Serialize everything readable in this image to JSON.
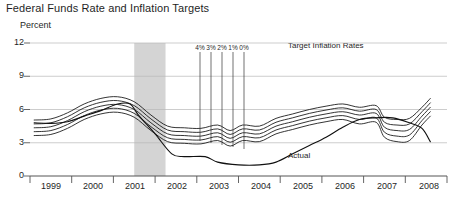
{
  "chart_data": {
    "type": "line",
    "title": "Federal Funds Rate and Inflation Targets",
    "subtitle": "Percent",
    "ylabel": "Percent",
    "xlabel": "",
    "ylim": [
      0,
      12
    ],
    "yticks": [
      0,
      3,
      6,
      9,
      12
    ],
    "ytick_labels": [
      "0",
      "3",
      "6",
      "9",
      "12"
    ],
    "xlim": [
      1998.5,
      2008.5
    ],
    "xtick_labels": [
      "1999",
      "2000",
      "2001",
      "2002",
      "2003",
      "2004",
      "2005",
      "2006",
      "2007",
      "2008"
    ],
    "grid": true,
    "legend_position": "inside-top-right",
    "annotations": {
      "target_rates_label": "Target Inflation Rates",
      "actual_label": "Actual",
      "target_tick_labels": [
        "4%",
        "3%",
        "2%",
        "1%",
        "0%"
      ],
      "recession_band": {
        "start": 2001.0,
        "end": 2001.75,
        "color": "#d4d4d4"
      }
    },
    "series": [
      {
        "name": "4% target",
        "label": "4%",
        "values": [
          [
            1998.6,
            5.05
          ],
          [
            1999.0,
            5.15
          ],
          [
            1999.4,
            5.7
          ],
          [
            1999.8,
            6.5
          ],
          [
            2000.2,
            7.0
          ],
          [
            2000.6,
            7.15
          ],
          [
            2001.0,
            6.7
          ],
          [
            2001.4,
            5.5
          ],
          [
            2001.8,
            4.5
          ],
          [
            2002.2,
            4.35
          ],
          [
            2002.6,
            4.3
          ],
          [
            2003.0,
            4.6
          ],
          [
            2003.3,
            4.1
          ],
          [
            2003.6,
            4.6
          ],
          [
            2004.0,
            4.5
          ],
          [
            2004.4,
            5.2
          ],
          [
            2004.8,
            5.6
          ],
          [
            2005.2,
            6.0
          ],
          [
            2005.6,
            6.3
          ],
          [
            2006.0,
            6.5
          ],
          [
            2006.4,
            6.2
          ],
          [
            2006.8,
            6.35
          ],
          [
            2007.0,
            5.3
          ],
          [
            2007.3,
            5.1
          ],
          [
            2007.6,
            5.2
          ],
          [
            2007.9,
            6.2
          ],
          [
            2008.1,
            7.0
          ]
        ]
      },
      {
        "name": "3% target",
        "label": "3%",
        "values": [
          [
            1998.6,
            4.7
          ],
          [
            1999.0,
            4.8
          ],
          [
            1999.4,
            5.35
          ],
          [
            1999.8,
            6.15
          ],
          [
            2000.2,
            6.65
          ],
          [
            2000.6,
            6.8
          ],
          [
            2001.0,
            6.35
          ],
          [
            2001.4,
            5.15
          ],
          [
            2001.8,
            4.15
          ],
          [
            2002.2,
            4.0
          ],
          [
            2002.6,
            3.95
          ],
          [
            2003.0,
            4.25
          ],
          [
            2003.3,
            3.75
          ],
          [
            2003.6,
            4.25
          ],
          [
            2004.0,
            4.15
          ],
          [
            2004.4,
            4.85
          ],
          [
            2004.8,
            5.25
          ],
          [
            2005.2,
            5.65
          ],
          [
            2005.6,
            5.95
          ],
          [
            2006.0,
            6.15
          ],
          [
            2006.4,
            5.85
          ],
          [
            2006.8,
            6.0
          ],
          [
            2007.0,
            4.85
          ],
          [
            2007.3,
            4.6
          ],
          [
            2007.6,
            4.7
          ],
          [
            2007.9,
            5.8
          ],
          [
            2008.1,
            6.6
          ]
        ]
      },
      {
        "name": "2% target",
        "label": "2%",
        "values": [
          [
            1998.6,
            4.35
          ],
          [
            1999.0,
            4.45
          ],
          [
            1999.4,
            5.0
          ],
          [
            1999.8,
            5.8
          ],
          [
            2000.2,
            6.3
          ],
          [
            2000.6,
            6.45
          ],
          [
            2001.0,
            6.0
          ],
          [
            2001.4,
            4.8
          ],
          [
            2001.8,
            3.8
          ],
          [
            2002.2,
            3.65
          ],
          [
            2002.6,
            3.6
          ],
          [
            2003.0,
            3.9
          ],
          [
            2003.3,
            3.4
          ],
          [
            2003.6,
            3.9
          ],
          [
            2004.0,
            3.8
          ],
          [
            2004.4,
            4.5
          ],
          [
            2004.8,
            4.9
          ],
          [
            2005.2,
            5.3
          ],
          [
            2005.6,
            5.6
          ],
          [
            2006.0,
            5.8
          ],
          [
            2006.4,
            5.5
          ],
          [
            2006.8,
            5.65
          ],
          [
            2007.0,
            4.4
          ],
          [
            2007.3,
            4.1
          ],
          [
            2007.6,
            4.2
          ],
          [
            2007.9,
            5.4
          ],
          [
            2008.1,
            6.2
          ]
        ]
      },
      {
        "name": "1% target",
        "label": "1%",
        "values": [
          [
            1998.6,
            4.0
          ],
          [
            1999.0,
            4.1
          ],
          [
            1999.4,
            4.65
          ],
          [
            1999.8,
            5.45
          ],
          [
            2000.2,
            5.95
          ],
          [
            2000.6,
            6.1
          ],
          [
            2001.0,
            5.65
          ],
          [
            2001.4,
            4.45
          ],
          [
            2001.8,
            3.45
          ],
          [
            2002.2,
            3.3
          ],
          [
            2002.6,
            3.25
          ],
          [
            2003.0,
            3.55
          ],
          [
            2003.3,
            3.05
          ],
          [
            2003.6,
            3.55
          ],
          [
            2004.0,
            3.45
          ],
          [
            2004.4,
            4.15
          ],
          [
            2004.8,
            4.55
          ],
          [
            2005.2,
            4.95
          ],
          [
            2005.6,
            5.25
          ],
          [
            2006.0,
            5.45
          ],
          [
            2006.4,
            5.1
          ],
          [
            2006.8,
            5.25
          ],
          [
            2007.0,
            3.95
          ],
          [
            2007.3,
            3.6
          ],
          [
            2007.6,
            3.7
          ],
          [
            2007.9,
            5.0
          ],
          [
            2008.1,
            5.8
          ]
        ]
      },
      {
        "name": "0% target",
        "label": "0%",
        "values": [
          [
            1998.6,
            3.65
          ],
          [
            1999.0,
            3.75
          ],
          [
            1999.4,
            4.3
          ],
          [
            1999.8,
            5.1
          ],
          [
            2000.2,
            5.6
          ],
          [
            2000.6,
            5.75
          ],
          [
            2001.0,
            5.3
          ],
          [
            2001.4,
            4.1
          ],
          [
            2001.8,
            3.1
          ],
          [
            2002.2,
            2.95
          ],
          [
            2002.6,
            2.9
          ],
          [
            2003.0,
            3.2
          ],
          [
            2003.3,
            2.7
          ],
          [
            2003.6,
            3.2
          ],
          [
            2004.0,
            3.1
          ],
          [
            2004.4,
            3.8
          ],
          [
            2004.8,
            4.2
          ],
          [
            2005.2,
            4.6
          ],
          [
            2005.6,
            4.9
          ],
          [
            2006.0,
            5.1
          ],
          [
            2006.4,
            4.7
          ],
          [
            2006.8,
            4.85
          ],
          [
            2007.0,
            3.5
          ],
          [
            2007.3,
            3.1
          ],
          [
            2007.6,
            3.2
          ],
          [
            2007.9,
            4.6
          ],
          [
            2008.1,
            5.4
          ]
        ]
      },
      {
        "name": "Actual",
        "label": "Actual",
        "values": [
          [
            1998.6,
            4.8
          ],
          [
            1999.0,
            4.75
          ],
          [
            1999.4,
            4.9
          ],
          [
            1999.8,
            5.4
          ],
          [
            2000.2,
            5.9
          ],
          [
            2000.6,
            6.5
          ],
          [
            2000.9,
            6.5
          ],
          [
            2001.1,
            5.5
          ],
          [
            2001.5,
            3.8
          ],
          [
            2001.9,
            2.0
          ],
          [
            2002.2,
            1.75
          ],
          [
            2002.7,
            1.75
          ],
          [
            2003.0,
            1.25
          ],
          [
            2003.5,
            1.0
          ],
          [
            2004.0,
            1.0
          ],
          [
            2004.4,
            1.25
          ],
          [
            2004.8,
            2.0
          ],
          [
            2005.2,
            2.75
          ],
          [
            2005.6,
            3.5
          ],
          [
            2006.0,
            4.4
          ],
          [
            2006.4,
            5.1
          ],
          [
            2006.8,
            5.25
          ],
          [
            2007.2,
            5.25
          ],
          [
            2007.6,
            4.8
          ],
          [
            2007.9,
            4.3
          ],
          [
            2008.1,
            3.1
          ]
        ]
      }
    ]
  },
  "axis": {
    "ytick_labels": [
      "12",
      "9",
      "6",
      "3",
      "0"
    ],
    "xtick_labels": [
      "1999",
      "2000",
      "2001",
      "2002",
      "2003",
      "2004",
      "2005",
      "2006",
      "2007",
      "2008"
    ]
  },
  "header": {
    "title": "Federal Funds Rate and Inflation Targets",
    "subtitle": "Percent"
  },
  "annotations": {
    "target_labels": [
      "4%",
      "3%",
      "2%",
      "1%",
      "0%"
    ],
    "legend": "Target Inflation Rates",
    "actual": "Actual"
  }
}
